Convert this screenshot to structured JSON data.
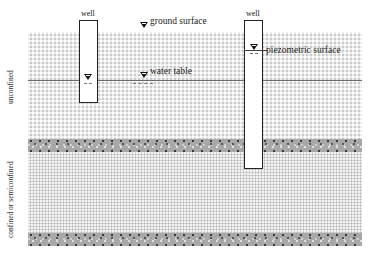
{
  "diagram": {
    "labels": {
      "ground_surface": "ground surface",
      "water_table": "water table",
      "piezometric_surface": "piezometric surface",
      "well_left": "well",
      "well_right": "well",
      "unconfined": "unconfined",
      "confined": "confined or semiconfined"
    },
    "layers": [
      {
        "name": "unconfined aquifer",
        "type": "sand"
      },
      {
        "name": "upper confining layer",
        "type": "clay"
      },
      {
        "name": "confined aquifer",
        "type": "sand"
      },
      {
        "name": "lower confining layer",
        "type": "clay"
      }
    ],
    "symbols": [
      "water-level-triangle"
    ]
  }
}
